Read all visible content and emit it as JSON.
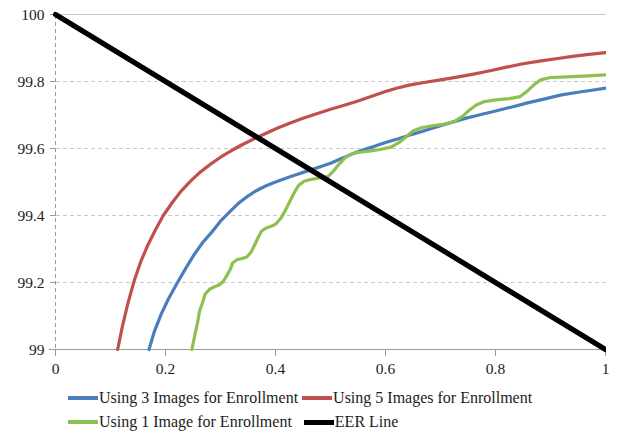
{
  "chart_data": {
    "type": "line",
    "title": "",
    "xlabel": "",
    "ylabel": "",
    "xlim": [
      0,
      1
    ],
    "ylim": [
      99,
      100
    ],
    "grid": true,
    "x_ticks": [
      "0",
      "0.2",
      "0.4",
      "0.6",
      "0.8",
      "1"
    ],
    "x_tick_values": [
      0,
      0.2,
      0.4,
      0.6,
      0.8,
      1
    ],
    "y_ticks": [
      "99",
      "99.2",
      "99.4",
      "99.6",
      "99.8",
      "100"
    ],
    "y_tick_values": [
      99,
      99.2,
      99.4,
      99.6,
      99.8,
      100
    ],
    "legend_position": "bottom",
    "series": [
      {
        "name": "Using 3 Images for Enrollment",
        "color": "#4A7EBB",
        "width": 3.2,
        "points": [
          [
            0.17,
            99.0
          ],
          [
            0.18,
            99.055
          ],
          [
            0.192,
            99.105
          ],
          [
            0.205,
            99.15
          ],
          [
            0.22,
            99.195
          ],
          [
            0.237,
            99.243
          ],
          [
            0.252,
            99.283
          ],
          [
            0.268,
            99.32
          ],
          [
            0.285,
            99.352
          ],
          [
            0.3,
            99.383
          ],
          [
            0.318,
            99.413
          ],
          [
            0.333,
            99.437
          ],
          [
            0.35,
            99.458
          ],
          [
            0.365,
            99.474
          ],
          [
            0.382,
            99.488
          ],
          [
            0.4,
            99.5
          ],
          [
            0.42,
            99.512
          ],
          [
            0.44,
            99.523
          ],
          [
            0.46,
            99.534
          ],
          [
            0.48,
            99.545
          ],
          [
            0.5,
            99.556
          ],
          [
            0.52,
            99.57
          ],
          [
            0.54,
            99.584
          ],
          [
            0.56,
            99.596
          ],
          [
            0.58,
            99.607
          ],
          [
            0.6,
            99.618
          ],
          [
            0.625,
            99.63
          ],
          [
            0.65,
            99.643
          ],
          [
            0.675,
            99.655
          ],
          [
            0.7,
            99.668
          ],
          [
            0.72,
            99.678
          ],
          [
            0.745,
            99.69
          ],
          [
            0.77,
            99.7
          ],
          [
            0.8,
            99.712
          ],
          [
            0.83,
            99.724
          ],
          [
            0.86,
            99.737
          ],
          [
            0.89,
            99.748
          ],
          [
            0.92,
            99.76
          ],
          [
            0.95,
            99.768
          ],
          [
            0.975,
            99.774
          ],
          [
            1.0,
            99.78
          ]
        ]
      },
      {
        "name": "Using 5 Images for Enrollment",
        "color": "#C0504D",
        "width": 3.2,
        "points": [
          [
            0.113,
            99.0
          ],
          [
            0.122,
            99.072
          ],
          [
            0.132,
            99.14
          ],
          [
            0.143,
            99.205
          ],
          [
            0.155,
            99.262
          ],
          [
            0.168,
            99.312
          ],
          [
            0.182,
            99.358
          ],
          [
            0.196,
            99.4
          ],
          [
            0.212,
            99.438
          ],
          [
            0.228,
            99.472
          ],
          [
            0.245,
            99.502
          ],
          [
            0.262,
            99.528
          ],
          [
            0.28,
            99.551
          ],
          [
            0.3,
            99.574
          ],
          [
            0.32,
            99.594
          ],
          [
            0.34,
            99.612
          ],
          [
            0.36,
            99.628
          ],
          [
            0.382,
            99.645
          ],
          [
            0.405,
            99.662
          ],
          [
            0.428,
            99.677
          ],
          [
            0.45,
            99.69
          ],
          [
            0.475,
            99.704
          ],
          [
            0.5,
            99.717
          ],
          [
            0.525,
            99.729
          ],
          [
            0.55,
            99.742
          ],
          [
            0.575,
            99.756
          ],
          [
            0.6,
            99.77
          ],
          [
            0.62,
            99.78
          ],
          [
            0.645,
            99.79
          ],
          [
            0.67,
            99.797
          ],
          [
            0.7,
            99.805
          ],
          [
            0.73,
            99.813
          ],
          [
            0.76,
            99.822
          ],
          [
            0.79,
            99.832
          ],
          [
            0.82,
            99.843
          ],
          [
            0.85,
            99.853
          ],
          [
            0.88,
            99.861
          ],
          [
            0.91,
            99.868
          ],
          [
            0.94,
            99.875
          ],
          [
            0.97,
            99.881
          ],
          [
            1.0,
            99.886
          ]
        ]
      },
      {
        "name": "Using 1 Image for Enrollment",
        "color": "#8CC152",
        "width": 3.2,
        "points": [
          [
            0.248,
            99.0
          ],
          [
            0.253,
            99.04
          ],
          [
            0.258,
            99.078
          ],
          [
            0.262,
            99.115
          ],
          [
            0.268,
            99.143
          ],
          [
            0.272,
            99.165
          ],
          [
            0.28,
            99.18
          ],
          [
            0.29,
            99.188
          ],
          [
            0.298,
            99.193
          ],
          [
            0.305,
            99.203
          ],
          [
            0.312,
            99.222
          ],
          [
            0.318,
            99.24
          ],
          [
            0.322,
            99.258
          ],
          [
            0.33,
            99.268
          ],
          [
            0.34,
            99.272
          ],
          [
            0.348,
            99.276
          ],
          [
            0.356,
            99.292
          ],
          [
            0.362,
            99.312
          ],
          [
            0.368,
            99.333
          ],
          [
            0.374,
            99.352
          ],
          [
            0.382,
            99.362
          ],
          [
            0.392,
            99.368
          ],
          [
            0.4,
            99.374
          ],
          [
            0.41,
            99.392
          ],
          [
            0.418,
            99.416
          ],
          [
            0.426,
            99.442
          ],
          [
            0.434,
            99.468
          ],
          [
            0.442,
            99.49
          ],
          [
            0.452,
            99.502
          ],
          [
            0.465,
            99.508
          ],
          [
            0.48,
            99.512
          ],
          [
            0.495,
            99.516
          ],
          [
            0.505,
            99.532
          ],
          [
            0.515,
            99.552
          ],
          [
            0.525,
            99.57
          ],
          [
            0.535,
            99.582
          ],
          [
            0.55,
            99.588
          ],
          [
            0.57,
            99.592
          ],
          [
            0.59,
            99.597
          ],
          [
            0.61,
            99.604
          ],
          [
            0.625,
            99.618
          ],
          [
            0.638,
            99.636
          ],
          [
            0.65,
            99.652
          ],
          [
            0.665,
            99.662
          ],
          [
            0.685,
            99.668
          ],
          [
            0.705,
            99.672
          ],
          [
            0.725,
            99.68
          ],
          [
            0.74,
            99.696
          ],
          [
            0.752,
            99.714
          ],
          [
            0.765,
            99.73
          ],
          [
            0.78,
            99.74
          ],
          [
            0.8,
            99.745
          ],
          [
            0.825,
            99.749
          ],
          [
            0.845,
            99.755
          ],
          [
            0.858,
            99.772
          ],
          [
            0.87,
            99.79
          ],
          [
            0.882,
            99.805
          ],
          [
            0.9,
            99.812
          ],
          [
            0.93,
            99.814
          ],
          [
            0.96,
            99.816
          ],
          [
            1.0,
            99.82
          ]
        ]
      },
      {
        "name": "EER Line",
        "color": "#000000",
        "width": 5.2,
        "points": [
          [
            0.0,
            100.0
          ],
          [
            1.0,
            99.0
          ]
        ]
      }
    ]
  },
  "legend": {
    "rows": [
      [
        {
          "label": "Using 3 Images for Enrollment",
          "color": "#4A7EBB",
          "thick": false,
          "swatch_name": "legend-swatch-blue"
        },
        {
          "label": "Using 5 Images for Enrollment",
          "color": "#C0504D",
          "thick": false,
          "swatch_name": "legend-swatch-red"
        }
      ],
      [
        {
          "label": "Using 1 Image for Enrollment",
          "color": "#8CC152",
          "thick": false,
          "swatch_name": "legend-swatch-green"
        },
        {
          "label": "EER Line",
          "color": "#000000",
          "thick": true,
          "swatch_name": "legend-swatch-black"
        }
      ]
    ]
  },
  "axes": {
    "axis_color": "#9a9a9a",
    "grid_color": "#c9c9c9",
    "tick_color": "#9a9a9a"
  }
}
